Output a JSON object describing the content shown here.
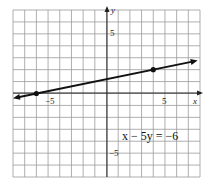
{
  "graph": {
    "equation": "x − 5y = −6",
    "x_axis_label": "x",
    "y_axis_label": "y",
    "tick_labels": {
      "x_neg": "−5",
      "x_pos": "5",
      "y_pos": "5",
      "y_neg": "−5"
    },
    "x_range": [
      -8,
      8
    ],
    "y_range": [
      -7,
      7
    ],
    "points": [
      {
        "x": -6,
        "y": 0
      },
      {
        "x": 4,
        "y": 2
      }
    ],
    "line_color": "#111111",
    "grid_color": "#9a9a9a"
  }
}
